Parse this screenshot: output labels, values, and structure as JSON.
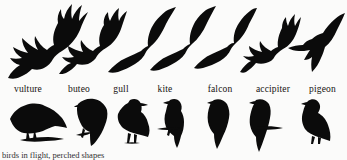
{
  "figure": {
    "kind": "bird-silhouette-identification-chart",
    "background_color": "#fbfbfa",
    "silhouette_color": "#0b0b0b",
    "caption_partial": "birds in flight, perched shapes"
  },
  "rows": {
    "flight_row_name": "birds-in-flight-silhouettes",
    "label_row_name": "species-name-labels",
    "perched_row_name": "perched-bird-silhouettes"
  },
  "species": [
    {
      "id": "vulture",
      "label": "vulture",
      "flight_x": 2,
      "flight_w": 86,
      "label_x": 0,
      "label_w": 56,
      "perched_x": 6,
      "perched_w": 62
    },
    {
      "id": "buteo",
      "label": "buteo",
      "flight_x": 56,
      "flight_w": 72,
      "label_x": 56,
      "label_w": 46,
      "perched_x": 74,
      "perched_w": 36
    },
    {
      "id": "gull",
      "label": "gull",
      "flight_x": 106,
      "flight_w": 72,
      "label_x": 104,
      "label_w": 34,
      "perched_x": 113,
      "perched_w": 40
    },
    {
      "id": "kite",
      "label": "kite",
      "flight_x": 148,
      "flight_w": 70,
      "label_x": 148,
      "label_w": 34,
      "perched_x": 157,
      "perched_w": 38
    },
    {
      "id": "falcon",
      "label": "falcon",
      "flight_x": 192,
      "flight_w": 66,
      "label_x": 198,
      "label_w": 44,
      "perched_x": 202,
      "perched_w": 34
    },
    {
      "id": "accipiter",
      "label": "accipiter",
      "flight_x": 238,
      "flight_w": 64,
      "label_x": 246,
      "label_w": 54,
      "perched_x": 246,
      "perched_w": 40
    },
    {
      "id": "pigeon",
      "label": "pigeon",
      "flight_x": 288,
      "flight_w": 58,
      "label_x": 304,
      "label_w": 43,
      "perched_x": 294,
      "perched_w": 42
    }
  ]
}
